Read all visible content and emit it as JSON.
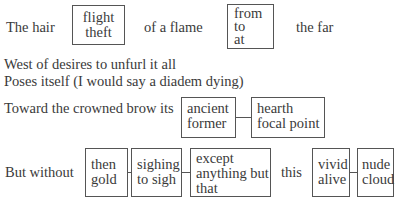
{
  "lines": {
    "l1": {
      "a": "The hair",
      "b": "of a flame",
      "c": "the far"
    },
    "l2": "West of desires to unfurl it all",
    "l3": "Poses itself (I would say a diadem dying)",
    "l4": "Toward the crowned brow its",
    "l5": {
      "a": "But without",
      "b": "this"
    }
  },
  "boxes": {
    "b1": [
      "flight",
      "theft"
    ],
    "b2": [
      "from",
      "to",
      "at"
    ],
    "b3": [
      "ancient",
      "former"
    ],
    "b4": [
      "hearth",
      "focal point"
    ],
    "b5": [
      "then",
      "gold"
    ],
    "b6": [
      "sighing",
      "to sigh"
    ],
    "b7": [
      "except",
      "anything but",
      "that"
    ],
    "b8": [
      "vivid",
      "alive"
    ],
    "b9": [
      "nude",
      "cloud"
    ]
  }
}
